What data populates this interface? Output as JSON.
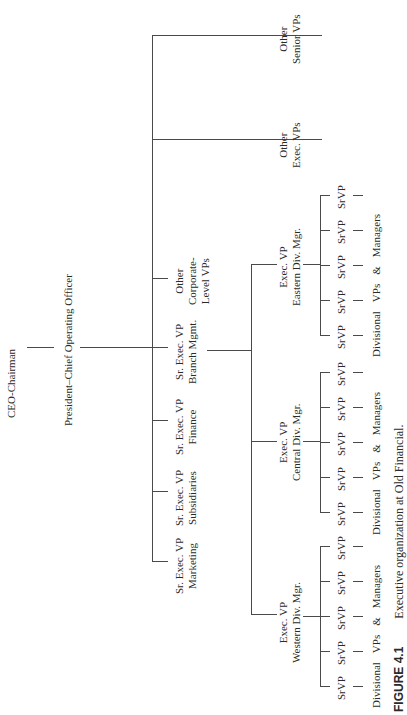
{
  "figure": {
    "number": "FIGURE 4.1",
    "caption": "Executive organization at Old Financial."
  },
  "chart": {
    "root": "CEO-Chairman",
    "president": "President–Chief Operating Officer",
    "president_reports": [
      {
        "line1": "Sr. Exec. VP",
        "line2": "Marketing"
      },
      {
        "line1": "Sr. Exec. VP",
        "line2": "Subsidiaries"
      },
      {
        "line1": "Sr. Exec. VP",
        "line2": "Finance"
      },
      {
        "line1": "Sr. Exec. VP",
        "line2": "Branch Mgmt."
      },
      {
        "line1": "Other",
        "line2": "Corporate-",
        "line3": "Level VPs"
      },
      {
        "line1": "Other",
        "line2": "Exec. VPs"
      },
      {
        "line1": "Other",
        "line2": "Senior VPs"
      }
    ],
    "divisions": [
      {
        "line1": "Exec. VP",
        "line2": "Western Div. Mgr.",
        "srvps": [
          "SrVP",
          "SrVP",
          "SrVP",
          "SrVP",
          "SrVP"
        ],
        "footer": [
          "Divisional",
          "VPs",
          "&",
          "Managers"
        ]
      },
      {
        "line1": "Exec. VP",
        "line2": "Central Div. Mgr.",
        "srvps": [
          "SrVP",
          "SrVP",
          "SrVP",
          "SrVP",
          "SrVP"
        ],
        "footer": [
          "Divisional",
          "VPs",
          "&",
          "Managers"
        ]
      },
      {
        "line1": "Exec. VP",
        "line2": "Eastern Div. Mgr.",
        "srvps": [
          "SrVP",
          "SrVP",
          "SrVP",
          "SrVP",
          "SrVP"
        ],
        "footer": [
          "Divisional",
          "VPs",
          "&",
          "Managers"
        ]
      }
    ]
  }
}
